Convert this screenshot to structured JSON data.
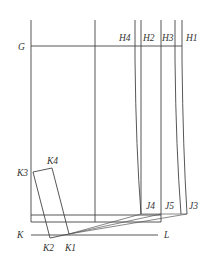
{
  "diagram": {
    "type": "pattern-drafting-construction",
    "labels": {
      "G": "G",
      "H1": "H1",
      "H2": "H2",
      "H3": "H3",
      "H4": "H4",
      "J3": "J3",
      "J4": "J4",
      "J5": "J5",
      "K": "K",
      "L": "L",
      "K1": "K1",
      "K2": "K2",
      "K3": "K3",
      "K4": "K4"
    },
    "colors": {
      "line": "#444444",
      "text": "#333333",
      "background": "#ffffff"
    }
  }
}
